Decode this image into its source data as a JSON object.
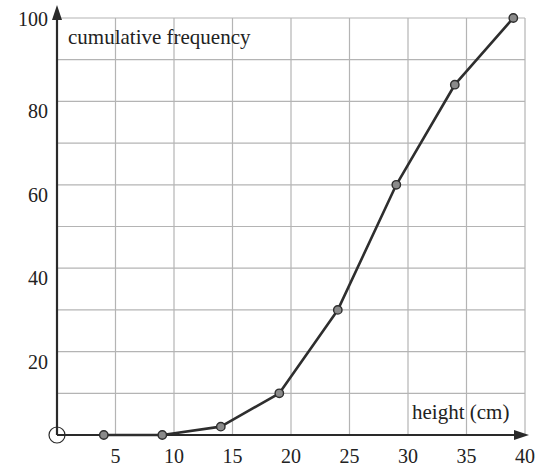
{
  "chart_data": {
    "type": "line",
    "title": "",
    "xlabel": "height (cm)",
    "ylabel": "cumulative frequency",
    "x": [
      4,
      9,
      14,
      19,
      24,
      29,
      34,
      39
    ],
    "series": [
      {
        "name": "cumulative frequency",
        "values": [
          0,
          0,
          2,
          10,
          30,
          60,
          84,
          100
        ]
      }
    ],
    "xlim": [
      0,
      40
    ],
    "ylim": [
      0,
      100
    ],
    "x_ticks": [
      5,
      10,
      15,
      20,
      25,
      30,
      35,
      40
    ],
    "x_tick_labels": [
      "5",
      "10",
      "15",
      "20",
      "25",
      "30",
      "35",
      "40"
    ],
    "y_ticks": [
      20,
      40,
      60,
      80,
      100
    ],
    "y_tick_labels": [
      "20",
      "40",
      "60",
      "80",
      "100"
    ],
    "origin_label": "O",
    "grid": true,
    "grid_x_step": 5,
    "grid_y_step": 10,
    "legend": null,
    "markers": "circle"
  },
  "colors": {
    "grid": "#b4b4b4",
    "axis": "#2a2a2a",
    "line": "#2e2e2e",
    "marker_fill": "#8a8a8a",
    "marker_stroke": "#2e2e2e",
    "text": "#222222"
  }
}
